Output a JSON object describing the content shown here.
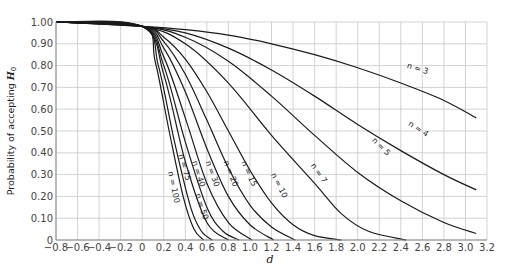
{
  "chart_data": {
    "type": "line",
    "title": "",
    "xlabel": "d",
    "ylabel": "Probability of accepting H0",
    "ylabel_main": "Probability of accepting ",
    "ylabel_italic": "H",
    "ylabel_sub": "0",
    "xlim": [
      -0.8,
      3.2
    ],
    "ylim": [
      0,
      1.0
    ],
    "grid": true,
    "x_ticks": [
      -0.8,
      -0.6,
      -0.4,
      -0.2,
      0,
      0.2,
      0.4,
      0.6,
      0.8,
      1.0,
      1.2,
      1.4,
      1.6,
      1.8,
      2.0,
      2.2,
      2.4,
      2.6,
      2.8,
      3.0,
      3.2
    ],
    "x_tick_labels": [
      "−0.8",
      "−0.6",
      "−0.4",
      "−0.2",
      "0",
      "0.2",
      "0.4",
      "0.6",
      "0.8",
      "1.0",
      "1.2",
      "1.4",
      "1.6",
      "1.8",
      "2.0",
      "2.2",
      "2.4",
      "2.6",
      "2.8",
      "3.0",
      "3.2"
    ],
    "y_ticks": [
      0,
      0.1,
      0.2,
      0.3,
      0.4,
      0.5,
      0.6,
      0.7,
      0.8,
      0.9,
      1.0
    ],
    "y_tick_labels": [
      "0",
      "0.10",
      "0.20",
      "0.30",
      "0.40",
      "0.50",
      "0.60",
      "0.70",
      "0.80",
      "0.90",
      "1.00"
    ],
    "series": [
      {
        "name": "n = 3",
        "label_x": 2.55,
        "label_y": 0.775,
        "label_rot": 17,
        "points": [
          [
            -0.8,
            1.0
          ],
          [
            0,
            0.98
          ],
          [
            0.4,
            0.965
          ],
          [
            0.8,
            0.94
          ],
          [
            1.2,
            0.9
          ],
          [
            1.6,
            0.85
          ],
          [
            2.0,
            0.79
          ],
          [
            2.4,
            0.72
          ],
          [
            2.8,
            0.64
          ],
          [
            3.1,
            0.56
          ]
        ]
      },
      {
        "name": "n = 4",
        "label_x": 2.55,
        "label_y": 0.5,
        "label_rot": 33,
        "points": [
          [
            -0.8,
            1.0
          ],
          [
            0,
            0.98
          ],
          [
            0.4,
            0.95
          ],
          [
            0.8,
            0.88
          ],
          [
            1.2,
            0.78
          ],
          [
            1.6,
            0.66
          ],
          [
            2.0,
            0.53
          ],
          [
            2.4,
            0.41
          ],
          [
            2.8,
            0.3
          ],
          [
            3.1,
            0.23
          ]
        ]
      },
      {
        "name": "n = 5",
        "label_x": 2.2,
        "label_y": 0.42,
        "label_rot": 45,
        "points": [
          [
            -0.8,
            1.0
          ],
          [
            0,
            0.98
          ],
          [
            0.4,
            0.93
          ],
          [
            0.8,
            0.82
          ],
          [
            1.2,
            0.66
          ],
          [
            1.6,
            0.48
          ],
          [
            2.0,
            0.31
          ],
          [
            2.4,
            0.18
          ],
          [
            2.8,
            0.08
          ],
          [
            3.1,
            0.03
          ]
        ]
      },
      {
        "name": "n = 7",
        "label_x": 1.62,
        "label_y": 0.3,
        "label_rot": 55,
        "points": [
          [
            -0.8,
            1.0
          ],
          [
            0,
            0.98
          ],
          [
            0.4,
            0.9
          ],
          [
            0.8,
            0.72
          ],
          [
            1.2,
            0.48
          ],
          [
            1.6,
            0.26
          ],
          [
            1.85,
            0.12
          ],
          [
            2.1,
            0.04
          ],
          [
            2.45,
            0.0
          ]
        ]
      },
      {
        "name": "n = 10",
        "label_x": 1.25,
        "label_y": 0.245,
        "label_rot": 63,
        "points": [
          [
            -0.8,
            1.0
          ],
          [
            0,
            0.98
          ],
          [
            0.2,
            0.93
          ],
          [
            0.4,
            0.83
          ],
          [
            0.6,
            0.68
          ],
          [
            0.8,
            0.5
          ],
          [
            1.0,
            0.32
          ],
          [
            1.2,
            0.17
          ],
          [
            1.4,
            0.07
          ],
          [
            1.6,
            0.02
          ],
          [
            1.85,
            0.0
          ]
        ]
      },
      {
        "name": "n = 15",
        "label_x": 0.97,
        "label_y": 0.3,
        "label_rot": 66,
        "points": [
          [
            -0.8,
            1.0
          ],
          [
            0,
            0.98
          ],
          [
            0.2,
            0.91
          ],
          [
            0.4,
            0.76
          ],
          [
            0.6,
            0.55
          ],
          [
            0.8,
            0.33
          ],
          [
            1.0,
            0.16
          ],
          [
            1.2,
            0.06
          ],
          [
            1.42,
            0.0
          ]
        ]
      },
      {
        "name": "n = 20",
        "label_x": 0.8,
        "label_y": 0.3,
        "label_rot": 68,
        "points": [
          [
            -0.8,
            1.0
          ],
          [
            0,
            0.98
          ],
          [
            0.2,
            0.88
          ],
          [
            0.4,
            0.68
          ],
          [
            0.6,
            0.42
          ],
          [
            0.8,
            0.2
          ],
          [
            1.0,
            0.07
          ],
          [
            1.22,
            0.0
          ]
        ]
      },
      {
        "name": "n = 30",
        "label_x": 0.63,
        "label_y": 0.3,
        "label_rot": 70,
        "points": [
          [
            -0.8,
            1.0
          ],
          [
            0,
            0.98
          ],
          [
            0.2,
            0.84
          ],
          [
            0.4,
            0.56
          ],
          [
            0.6,
            0.26
          ],
          [
            0.8,
            0.08
          ],
          [
            1.02,
            0.0
          ]
        ]
      },
      {
        "name": "n = 40",
        "label_x": 0.5,
        "label_y": 0.3,
        "label_rot": 72,
        "points": [
          [
            -0.8,
            1.0
          ],
          [
            0,
            0.98
          ],
          [
            0.2,
            0.8
          ],
          [
            0.4,
            0.45
          ],
          [
            0.6,
            0.15
          ],
          [
            0.75,
            0.04
          ],
          [
            0.9,
            0.0
          ]
        ]
      },
      {
        "name": "n = 50",
        "label_x": 0.53,
        "label_y": 0.15,
        "label_rot": 72,
        "points": [
          [
            -0.8,
            1.0
          ],
          [
            0,
            0.98
          ],
          [
            0.2,
            0.76
          ],
          [
            0.4,
            0.36
          ],
          [
            0.6,
            0.08
          ],
          [
            0.8,
            0.0
          ]
        ]
      },
      {
        "name": "n = 75",
        "label_x": 0.37,
        "label_y": 0.33,
        "label_rot": 74,
        "points": [
          [
            -0.8,
            1.0
          ],
          [
            0,
            0.98
          ],
          [
            0.15,
            0.8
          ],
          [
            0.3,
            0.45
          ],
          [
            0.45,
            0.15
          ],
          [
            0.55,
            0.04
          ],
          [
            0.65,
            0.0
          ]
        ]
      },
      {
        "name": "n = 100",
        "label_x": 0.27,
        "label_y": 0.24,
        "label_rot": 78,
        "points": [
          [
            -0.8,
            1.0
          ],
          [
            0,
            0.98
          ],
          [
            0.12,
            0.82
          ],
          [
            0.25,
            0.5
          ],
          [
            0.38,
            0.2
          ],
          [
            0.48,
            0.05
          ],
          [
            0.57,
            0.0
          ]
        ]
      }
    ]
  }
}
